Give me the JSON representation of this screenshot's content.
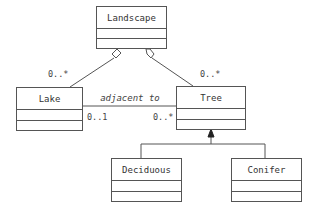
{
  "diagram": {
    "type": "UML class diagram",
    "classes": [
      {
        "id": "landscape",
        "name": "Landscape"
      },
      {
        "id": "lake",
        "name": "Lake"
      },
      {
        "id": "tree",
        "name": "Tree"
      },
      {
        "id": "deciduous",
        "name": "Deciduous"
      },
      {
        "id": "conifer",
        "name": "Conifer"
      }
    ],
    "relationships": [
      {
        "type": "aggregation",
        "whole": "Landscape",
        "part": "Lake",
        "part_multiplicity": "0..*"
      },
      {
        "type": "aggregation",
        "whole": "Landscape",
        "part": "Tree",
        "part_multiplicity": "0..*"
      },
      {
        "type": "association",
        "from": "Lake",
        "to": "Tree",
        "label": "adjacent to",
        "from_multiplicity": "0..1",
        "to_multiplicity": "0..*"
      },
      {
        "type": "generalization",
        "parent": "Tree",
        "children": [
          "Deciduous",
          "Conifer"
        ]
      }
    ],
    "labels": {
      "landscape": "Landscape",
      "lake": "Lake",
      "tree": "Tree",
      "deciduous": "Deciduous",
      "conifer": "Conifer",
      "adjacent": "adjacent to",
      "mult_lake_agg": "0..*",
      "mult_tree_agg": "0..*",
      "mult_lake_assoc": "0..1",
      "mult_tree_assoc": "0..*"
    },
    "colors": {
      "line": "#555555",
      "text": "#333333",
      "background": "#ffffff"
    }
  }
}
